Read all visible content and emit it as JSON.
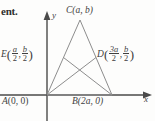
{
  "figure": {
    "kind": "coordinate-geometry-diagram",
    "surrounding_text_fragment": "ent.",
    "axes": {
      "x_label": "x",
      "y_label": "y",
      "origin_label": "A (0, 0)"
    },
    "colors": {
      "background": "#fdfdfc",
      "line": "#8d8d8d",
      "axis": "#4a4a4a",
      "text": "#3f3f3f"
    },
    "points": [
      {
        "id": "A",
        "name": "A",
        "label": "A (0, 0)",
        "coord_text": "(0, 0)",
        "x": 47,
        "y": 95
      },
      {
        "id": "B",
        "name": "B",
        "label": "B (2a, 0)",
        "coord_text": "(2a, 0)",
        "x": 112,
        "y": 95
      },
      {
        "id": "C",
        "name": "C",
        "label": "C (a, b)",
        "coord_text": "(a, b)",
        "x": 80,
        "y": 20
      },
      {
        "id": "D",
        "name": "D",
        "label": "D(3a/2, b/2)",
        "x": 96,
        "y": 57
      },
      {
        "id": "E",
        "name": "E",
        "label": "E(a/2, b/2)",
        "x": 63,
        "y": 57
      }
    ],
    "labels": {
      "c": {
        "name": "C",
        "coords": "(a, b)"
      },
      "a": {
        "name": "A",
        "coords": "(0, 0)"
      },
      "b": {
        "name": "B",
        "coords": "(2a, 0)"
      },
      "e": {
        "name": "E",
        "open": "(",
        "frac1_num": "a",
        "frac1_den": "2",
        "comma": ",",
        "frac2_num": "b",
        "frac2_den": "2",
        "close": ")"
      },
      "d": {
        "name": "D",
        "open": "(",
        "frac1_num": "3a",
        "frac1_den": "2",
        "comma": ",",
        "frac2_num": "b",
        "frac2_den": "2",
        "close": ")"
      }
    }
  }
}
